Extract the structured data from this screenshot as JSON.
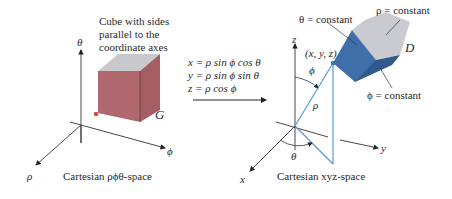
{
  "left_panel": {
    "caption_lines": [
      "Cube with sides",
      "parallel to the",
      "coordinate axes"
    ],
    "axis_theta": "θ",
    "axis_phi": "ϕ",
    "axis_rho": "ρ",
    "region_label": "G",
    "space_label": "Cartesian ρϕθ-space"
  },
  "transform": {
    "eq1": "x = ρ sin ϕ cos θ",
    "eq2": "y = ρ sin ϕ sin θ",
    "eq3": "z = ρ cos ϕ"
  },
  "right_panel": {
    "axis_z": "z",
    "axis_y": "y",
    "axis_x": "x",
    "point_label": "(x, y, z)",
    "phi_angle": "ϕ",
    "rho_label": "ρ",
    "theta_angle": "θ",
    "theta_const": "θ = constant",
    "rho_const": "ρ = constant",
    "phi_const": "ϕ = constant",
    "region_label": "D",
    "space_label": "Cartesian xyz-space"
  },
  "colors": {
    "cube_side": "#b06a70",
    "cube_top": "#c8c8cc",
    "wedge_blue": "#3f6fa8",
    "wedge_gray": "#c9cbd0",
    "line_blue": "#5a9ad6"
  }
}
